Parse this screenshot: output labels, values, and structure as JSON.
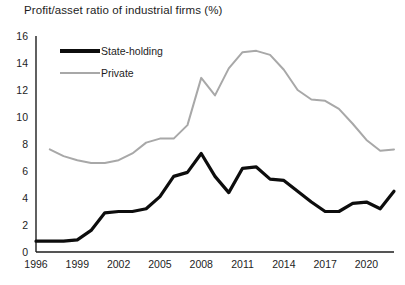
{
  "chart_data": {
    "type": "line",
    "title": "Profit/asset ratio of industrial firms (%)",
    "xlabel": "",
    "ylabel": "",
    "ylim": [
      0,
      16
    ],
    "xlim": [
      1996,
      2022
    ],
    "ytick_labels": [
      "0",
      "2",
      "4",
      "6",
      "8",
      "10",
      "12",
      "14",
      "16"
    ],
    "ytick_values": [
      0,
      2,
      4,
      6,
      8,
      10,
      12,
      14,
      16
    ],
    "xtick_labels": [
      "1996",
      "1999",
      "2002",
      "2005",
      "2008",
      "2011",
      "2014",
      "2017",
      "2020"
    ],
    "xtick_values": [
      1996,
      1999,
      2002,
      2005,
      2008,
      2011,
      2014,
      2017,
      2020
    ],
    "grid": false,
    "legend_position": "upper-left inside",
    "x": [
      1996,
      1997,
      1998,
      1999,
      2000,
      2001,
      2002,
      2003,
      2004,
      2005,
      2006,
      2007,
      2008,
      2009,
      2010,
      2011,
      2012,
      2013,
      2014,
      2015,
      2016,
      2017,
      2018,
      2019,
      2020,
      2021,
      2022
    ],
    "series": [
      {
        "name": "State-holding",
        "color": "#0d0d0d",
        "width": 3.2,
        "values": [
          0.8,
          0.8,
          0.8,
          0.9,
          1.6,
          2.9,
          3.0,
          3.0,
          3.2,
          4.1,
          5.6,
          5.9,
          7.3,
          5.6,
          4.4,
          6.2,
          6.3,
          5.4,
          5.3,
          4.5,
          3.7,
          3.0,
          3.0,
          3.6,
          3.7,
          3.2,
          4.5
        ]
      },
      {
        "name": "Private",
        "color": "#a8a8a8",
        "width": 2.0,
        "values": [
          null,
          7.6,
          7.1,
          6.8,
          6.6,
          6.6,
          6.8,
          7.3,
          8.1,
          8.4,
          8.4,
          9.4,
          12.9,
          11.6,
          13.6,
          14.8,
          14.9,
          14.6,
          13.5,
          12.0,
          11.3,
          11.2,
          10.6,
          9.5,
          8.3,
          7.5,
          7.6
        ]
      }
    ]
  }
}
